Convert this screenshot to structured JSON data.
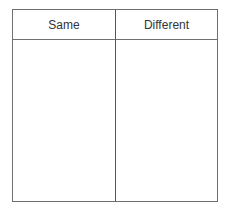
{
  "table": {
    "columns": [
      {
        "header": "Same",
        "cells": []
      },
      {
        "header": "Different",
        "cells": []
      }
    ]
  }
}
